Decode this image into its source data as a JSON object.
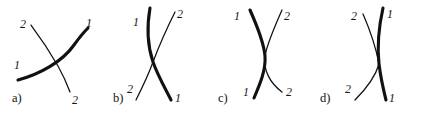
{
  "figure": {
    "width": 421,
    "height": 114,
    "background_color": "#ffffff",
    "ink_color": "#111111"
  },
  "panels": [
    {
      "id": "panel-a",
      "caption": "a)",
      "caption_x": 12,
      "caption_y": 92,
      "origin_x": 0,
      "curves": [
        {
          "name": "curve-1",
          "label": "1",
          "weight": "thick",
          "path": "M 18 80 C 40 74, 62 62, 74 45 C 79 38, 84 32, 88 28"
        },
        {
          "name": "curve-2",
          "label": "2",
          "weight": "thin",
          "path": "M 31 25 C 40 37, 50 52, 58 66 C 63 75, 67 84, 70 92"
        }
      ],
      "labels": [
        {
          "name": "label-2-top-left",
          "text": "2",
          "x": 20,
          "y": 18
        },
        {
          "name": "label-1-top-right",
          "text": "1",
          "x": 86,
          "y": 17
        },
        {
          "name": "label-1-bottom-left",
          "text": "1",
          "x": 14,
          "y": 59
        },
        {
          "name": "label-2-bottom-right",
          "text": "2",
          "x": 72,
          "y": 94
        }
      ]
    },
    {
      "id": "panel-b",
      "caption": "b)",
      "caption_x": 113,
      "caption_y": 92,
      "origin_x": 105,
      "curves": [
        {
          "name": "curve-1",
          "label": "1",
          "weight": "thick",
          "path": "M 45 8 C 42 25, 42 44, 48 62 C 53 76, 60 88, 66 100"
        },
        {
          "name": "curve-2",
          "label": "2",
          "weight": "thin",
          "path": "M 70 12 C 62 28, 54 46, 48 62 C 43 76, 37 88, 31 100"
        }
      ],
      "labels": [
        {
          "name": "label-1-top-left",
          "text": "1",
          "x": 28,
          "y": 16
        },
        {
          "name": "label-2-top-right",
          "text": "2",
          "x": 72,
          "y": 8
        },
        {
          "name": "label-2-bottom-left",
          "text": "2",
          "x": 22,
          "y": 83
        },
        {
          "name": "label-1-bottom-right",
          "text": "1",
          "x": 70,
          "y": 92
        }
      ]
    },
    {
      "id": "panel-c",
      "caption": "c)",
      "caption_x": 218,
      "caption_y": 92,
      "origin_x": 210,
      "curves": [
        {
          "name": "curve-1",
          "label": "1",
          "weight": "thick",
          "path": "M 40 10 C 48 28, 54 44, 55 56 C 56 70, 50 84, 44 98"
        },
        {
          "name": "curve-2",
          "label": "2",
          "weight": "thin",
          "path": "M 72 10 C 64 28, 57 44, 55 56 C 53 70, 60 83, 72 92"
        }
      ],
      "labels": [
        {
          "name": "label-1-top-left",
          "text": "1",
          "x": 24,
          "y": 10
        },
        {
          "name": "label-2-top-right",
          "text": "2",
          "x": 74,
          "y": 10
        },
        {
          "name": "label-1-bottom-left",
          "text": "1",
          "x": 33,
          "y": 86
        },
        {
          "name": "label-2-bottom-right",
          "text": "2",
          "x": 76,
          "y": 86
        }
      ]
    },
    {
      "id": "panel-d",
      "caption": "d)",
      "caption_x": 320,
      "caption_y": 92,
      "origin_x": 315,
      "curves": [
        {
          "name": "curve-1",
          "label": "1",
          "weight": "thick",
          "path": "M 68 8 C 64 26, 62 46, 64 64 C 66 80, 69 92, 71 100"
        },
        {
          "name": "curve-2",
          "label": "2",
          "weight": "thin",
          "path": "M 48 14 C 55 30, 61 48, 64 64 C 60 78, 50 90, 40 100"
        }
      ],
      "labels": [
        {
          "name": "label-2-top-left",
          "text": "2",
          "x": 36,
          "y": 10
        },
        {
          "name": "label-1-top-right",
          "text": "1",
          "x": 72,
          "y": 8
        },
        {
          "name": "label-2-bottom-left",
          "text": "2",
          "x": 30,
          "y": 83
        },
        {
          "name": "label-1-bottom-right",
          "text": "1",
          "x": 74,
          "y": 92
        }
      ]
    }
  ]
}
